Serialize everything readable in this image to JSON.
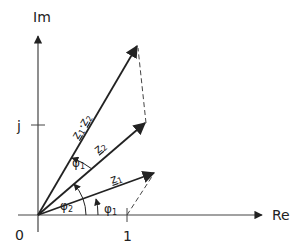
{
  "diagram": {
    "axes": {
      "real_label": "Re",
      "imag_label": "Im",
      "origin_label": "0",
      "real_tick_label": "1",
      "imag_tick_label": "j"
    },
    "vectors": [
      {
        "id": "z1",
        "label": "z",
        "subscript": "1"
      },
      {
        "id": "z2",
        "label": "z",
        "subscript": "2"
      },
      {
        "id": "z1z2",
        "label": "z",
        "subscript": "1",
        "label2": "z",
        "subscript2": "2"
      }
    ],
    "angles": [
      {
        "id": "phi1-base",
        "label": "φ",
        "subscript": "1"
      },
      {
        "id": "phi2",
        "label": "φ",
        "subscript": "2"
      },
      {
        "id": "phi1-top",
        "label": "φ",
        "subscript": "1"
      }
    ],
    "colors": {
      "ink": "#222222",
      "background": "#ffffff"
    }
  }
}
